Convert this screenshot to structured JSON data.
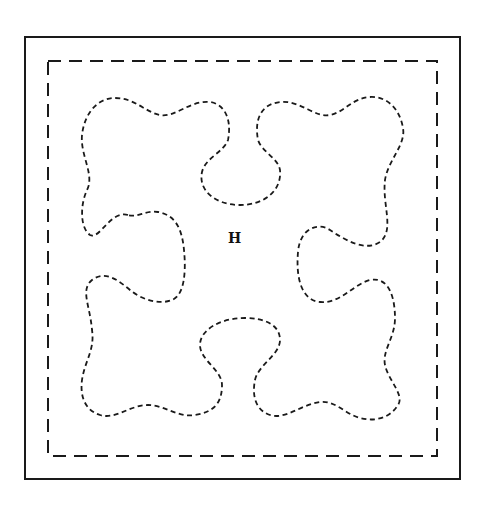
{
  "diagram": {
    "type": "quilting-pattern-template",
    "center_label": "H",
    "colors": {
      "line": "#1a1a1a",
      "background": "#ffffff"
    },
    "elements": [
      {
        "name": "outer-border",
        "style": "solid"
      },
      {
        "name": "inner-border",
        "style": "dashed"
      },
      {
        "name": "four-lobed-motif",
        "style": "dashed",
        "lobes": 4
      }
    ]
  }
}
